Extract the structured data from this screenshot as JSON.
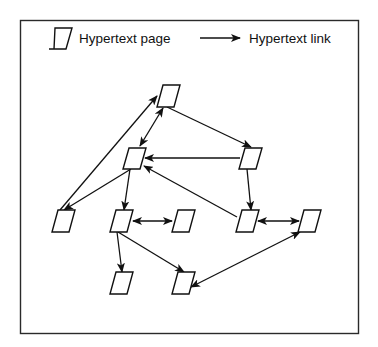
{
  "legend": {
    "page_label": "Hypertext page",
    "link_label": "Hypertext link"
  },
  "diagram": {
    "node_type": "Hypertext page",
    "edge_type": "Hypertext link",
    "nodes": [
      {
        "id": "A",
        "x": 168,
        "y": 96
      },
      {
        "id": "B",
        "x": 134,
        "y": 158
      },
      {
        "id": "C",
        "x": 250,
        "y": 158
      },
      {
        "id": "D",
        "x": 63,
        "y": 221
      },
      {
        "id": "E",
        "x": 121,
        "y": 221
      },
      {
        "id": "F",
        "x": 183,
        "y": 221
      },
      {
        "id": "G",
        "x": 247,
        "y": 221
      },
      {
        "id": "H",
        "x": 309,
        "y": 221
      },
      {
        "id": "I",
        "x": 121,
        "y": 283
      },
      {
        "id": "J",
        "x": 183,
        "y": 283
      }
    ],
    "edges": [
      {
        "from": "A",
        "to": "B",
        "bidirectional": true
      },
      {
        "from": "D",
        "to": "A",
        "bidirectional": false
      },
      {
        "from": "A",
        "to": "C",
        "bidirectional": false
      },
      {
        "from": "C",
        "to": "B",
        "bidirectional": false
      },
      {
        "from": "B",
        "to": "D",
        "bidirectional": false
      },
      {
        "from": "B",
        "to": "E",
        "bidirectional": false
      },
      {
        "from": "G",
        "to": "B",
        "bidirectional": false
      },
      {
        "from": "C",
        "to": "G",
        "bidirectional": false
      },
      {
        "from": "E",
        "to": "F",
        "bidirectional": true
      },
      {
        "from": "G",
        "to": "H",
        "bidirectional": true
      },
      {
        "from": "E",
        "to": "I",
        "bidirectional": false
      },
      {
        "from": "E",
        "to": "J",
        "bidirectional": false
      },
      {
        "from": "J",
        "to": "H",
        "bidirectional": true
      }
    ]
  }
}
